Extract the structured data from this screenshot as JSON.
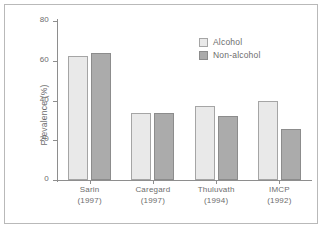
{
  "chart_data": {
    "type": "bar",
    "title": "",
    "xlabel": "",
    "ylabel": "Prevalence (%)",
    "ylim": [
      0,
      80
    ],
    "yticks": [
      0,
      20,
      40,
      60,
      80
    ],
    "grid": false,
    "legend_position": "top-right",
    "categories": [
      {
        "name": "Sarin",
        "year": "(1997)"
      },
      {
        "name": "Caregard",
        "year": "(1997)"
      },
      {
        "name": "Thuluvath",
        "year": "(1994)"
      },
      {
        "name": "IMCP",
        "year": "(1992)"
      }
    ],
    "series": [
      {
        "name": "Alcohol",
        "color": "#e9e9e9",
        "values": [
          62.5,
          33.5,
          37,
          40
        ]
      },
      {
        "name": "Non-alcohol",
        "color": "#ababab",
        "values": [
          64,
          33.5,
          32,
          25.5
        ]
      }
    ]
  }
}
